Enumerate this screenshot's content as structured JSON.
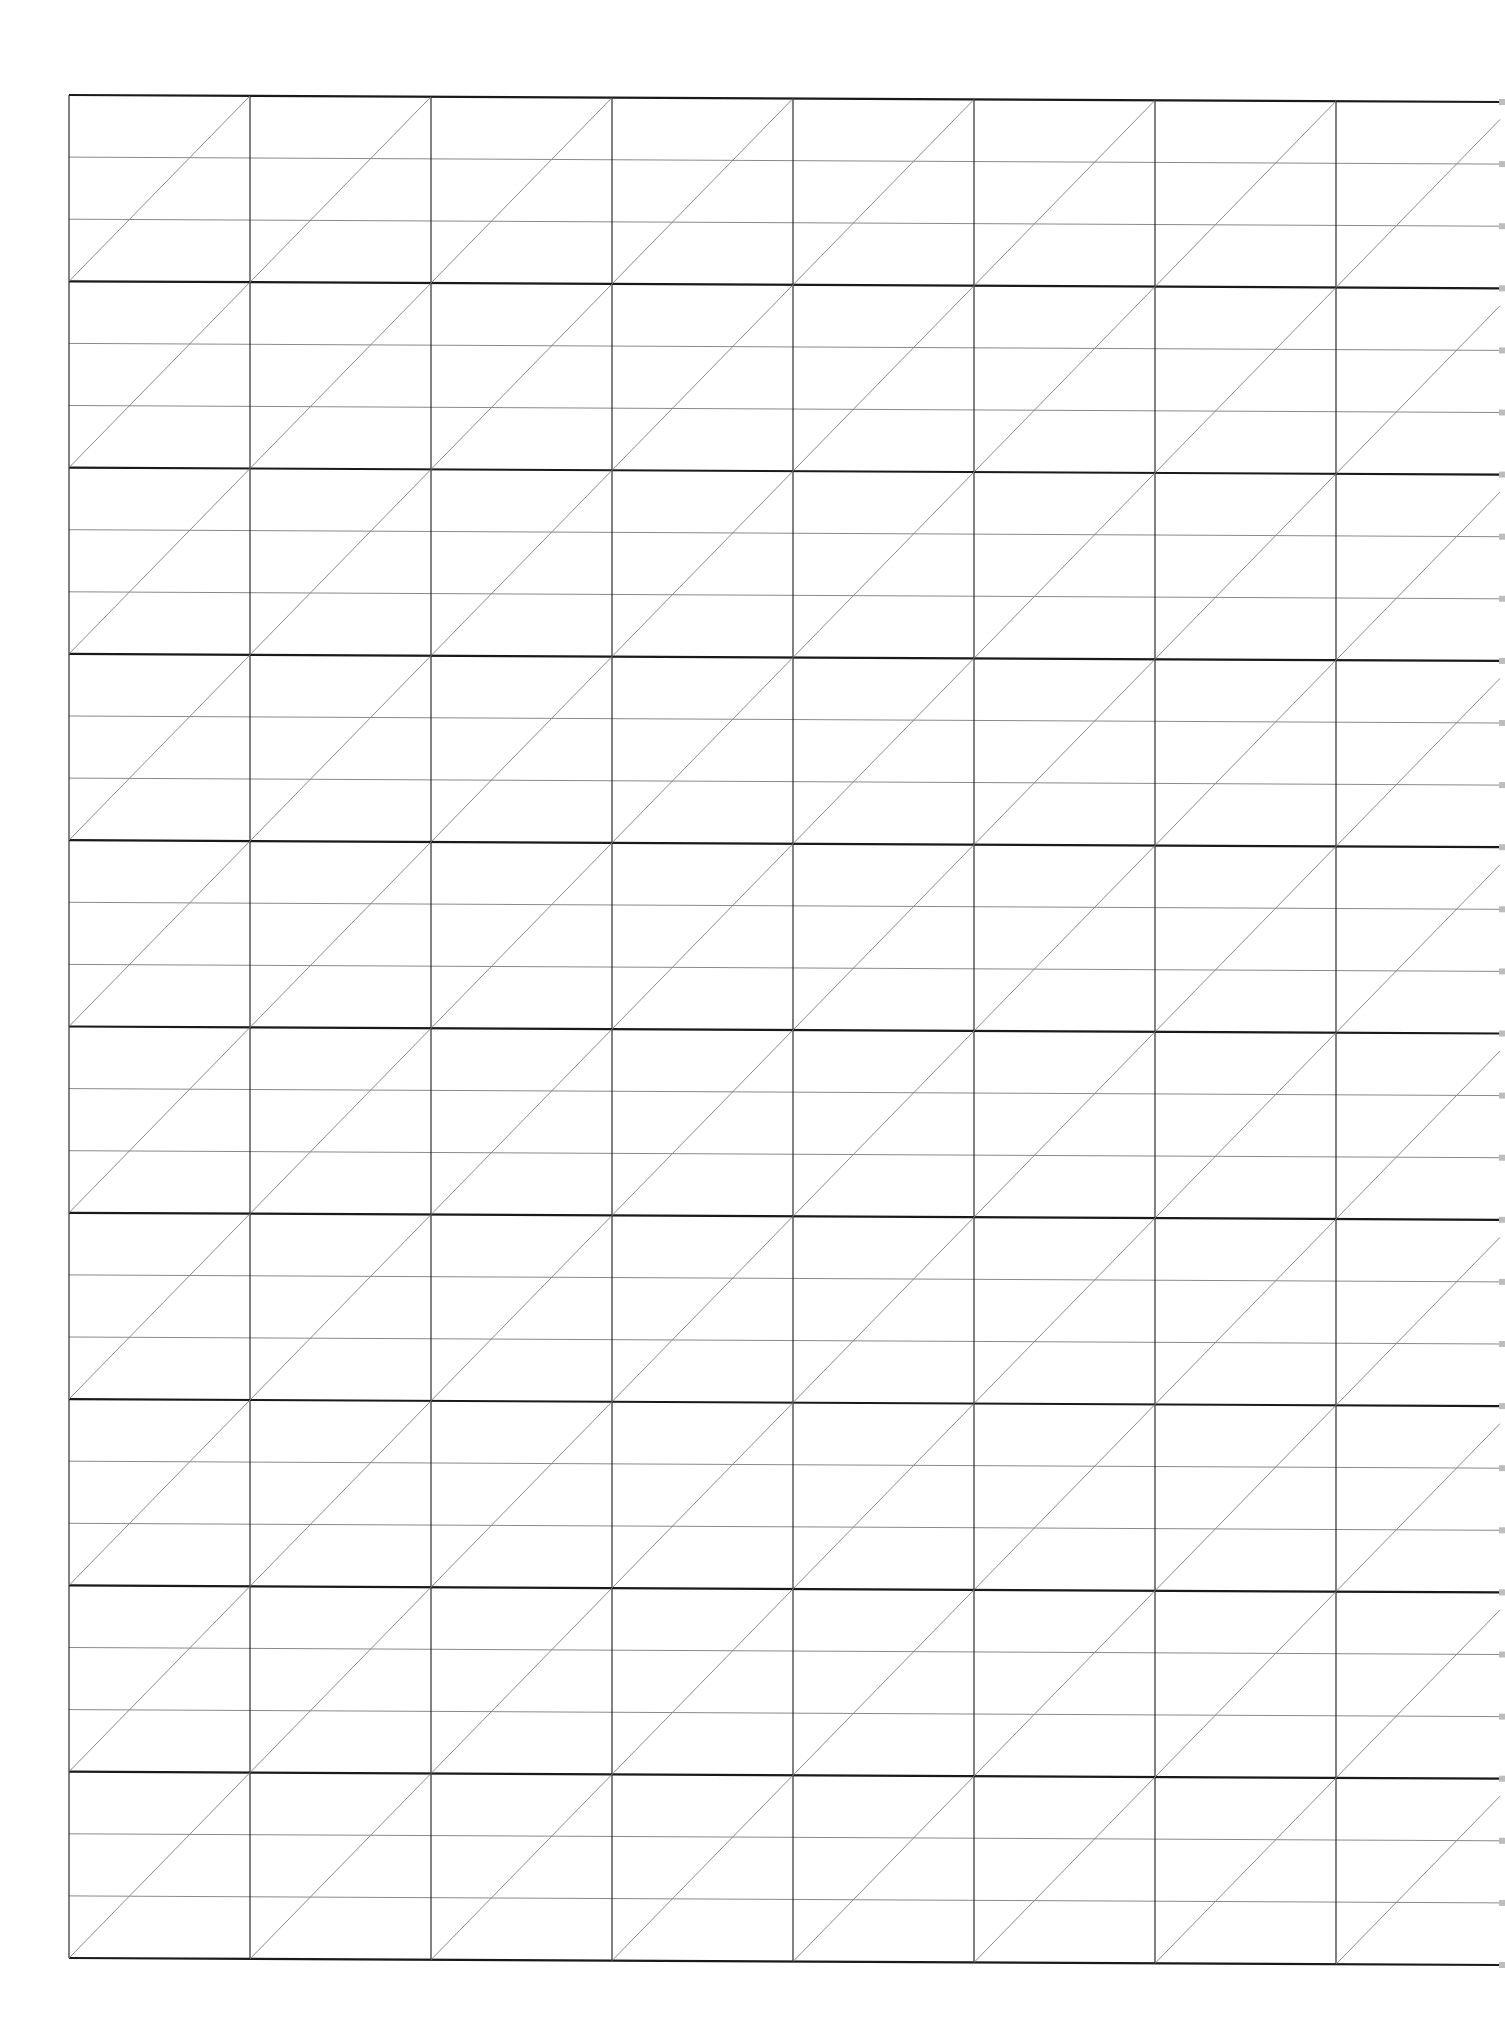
{
  "document": {
    "type": "slanted-lettering-guide-sheet",
    "background": "#ffffff",
    "line_color_major": "#1a1a1a",
    "line_color_minor": "#8a8a8a",
    "grid": {
      "left": 69,
      "right": 1500,
      "top": 95,
      "bottom": 1958,
      "bands": 10,
      "subdivisions_per_band": 3,
      "column_spacing": 181,
      "columns": 8,
      "slant_direction": "bottom-left-to-top-right"
    }
  }
}
